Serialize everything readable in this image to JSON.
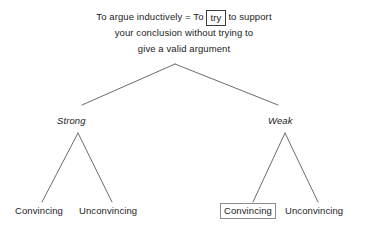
{
  "diagram": {
    "background_color": "#ffffff",
    "line_color": "#6b6b6b",
    "text_color": "#1c1c1c",
    "box_border_color": "#3a3a3a",
    "root": {
      "line1_prefix": "To argue inductively = To",
      "line1_boxed_word": "try",
      "line1_suffix": "to support",
      "line2": "your conclusion without trying to",
      "line3": "give a valid argument"
    },
    "branches": [
      {
        "label": "Strong",
        "style": "italic"
      },
      {
        "label": "Weak",
        "style": "italic"
      }
    ],
    "leaves": [
      {
        "label": "Convincing",
        "parent": "Strong",
        "boxed": false
      },
      {
        "label": "Unconvincing",
        "parent": "Strong",
        "boxed": false
      },
      {
        "label": "Convincing",
        "parent": "Weak",
        "boxed": true
      },
      {
        "label": "Unconvincing",
        "parent": "Weak",
        "boxed": false
      }
    ],
    "edges": {
      "root_apex": [
        175,
        64
      ],
      "root_left_end": [
        82,
        105
      ],
      "root_right_end": [
        278,
        105
      ],
      "strong_apex": [
        78,
        133
      ],
      "strong_left_end": [
        42,
        202
      ],
      "strong_right_end": [
        112,
        202
      ],
      "weak_apex": [
        285,
        133
      ],
      "weak_left_end": [
        253,
        202
      ],
      "weak_right_end": [
        318,
        202
      ]
    }
  }
}
